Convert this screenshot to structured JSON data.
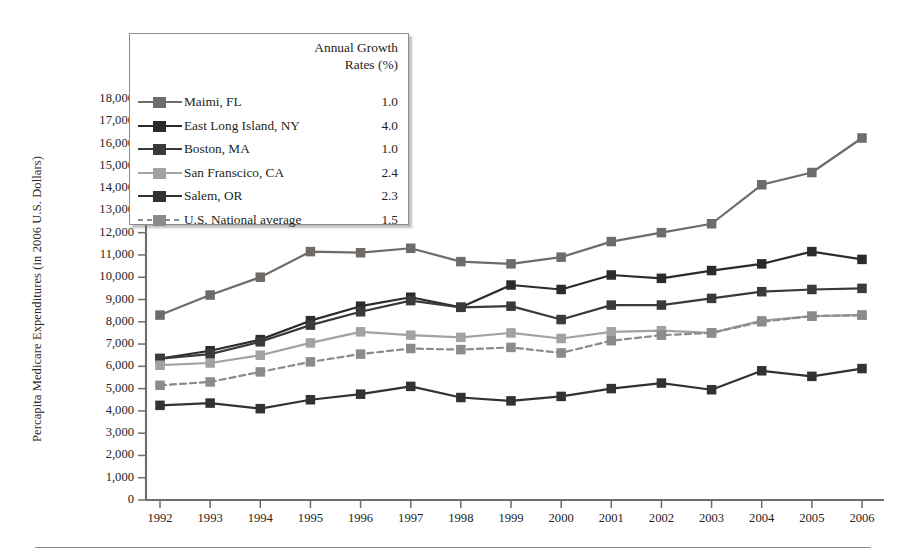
{
  "figure": {
    "y_axis_title": "Percapita Medicare Expenditures (in 2006 U.S. Dollars)",
    "legend_title_line1": "Annual Growth",
    "legend_title_line2": "Rates (%)"
  },
  "chart_data": {
    "type": "line",
    "title": "",
    "xlabel": "",
    "ylabel": "Percapita Medicare Expenditures (in 2006 U.S. Dollars)",
    "ylim": [
      0,
      18000
    ],
    "ytick_step": 1000,
    "yticks": [
      "0",
      "1,000",
      "2,000",
      "3,000",
      "4,000",
      "5,000",
      "6,000",
      "7,000",
      "8,000",
      "9,000",
      "10,000",
      "11,000",
      "12,000",
      "13,000",
      "14,000",
      "15,000",
      "16,000",
      "17,000",
      "18,000"
    ],
    "grid": false,
    "legend_position": "upper-left-inset",
    "categories": [
      1992,
      1993,
      1994,
      1995,
      1996,
      1997,
      1998,
      1999,
      2000,
      2001,
      2002,
      2003,
      2004,
      2005,
      2006
    ],
    "xtick_labels": [
      "1992",
      "1993",
      "1994",
      "1995",
      "1996",
      "1997",
      "1998",
      "1999",
      "2000",
      "2001",
      "2002",
      "2003",
      "2004",
      "2005",
      "2006"
    ],
    "series": [
      {
        "name": "Maimi, FL",
        "growth_rate": "1.0",
        "color": "#6e6b69",
        "dash": "solid",
        "values": [
          8300,
          9200,
          10000,
          11150,
          11100,
          11300,
          10700,
          10600,
          10900,
          11600,
          12000,
          12400,
          14150,
          14700,
          16250
        ]
      },
      {
        "name": "East Long Island, NY",
        "growth_rate": "4.0",
        "color": "#2b2b2b",
        "dash": "solid",
        "values": [
          6350,
          6700,
          7200,
          8050,
          8700,
          9100,
          8650,
          9650,
          9450,
          10100,
          9950,
          10300,
          10600,
          11150,
          10800
        ]
      },
      {
        "name": "Boston, MA",
        "growth_rate": "1.0",
        "color": "#3c3a39",
        "dash": "solid",
        "values": [
          6350,
          6550,
          7100,
          7850,
          8450,
          8950,
          8650,
          8700,
          8100,
          8750,
          8750,
          9050,
          9350,
          9450,
          9500
        ]
      },
      {
        "name": "San Franscico, CA",
        "growth_rate": "2.4",
        "color": "#a4a2a0",
        "dash": "solid",
        "values": [
          6050,
          6150,
          6500,
          7050,
          7550,
          7400,
          7300,
          7500,
          7250,
          7550,
          7600,
          7500,
          8050,
          8250,
          8300
        ]
      },
      {
        "name": "Salem, OR",
        "growth_rate": "2.3",
        "color": "#333132",
        "dash": "solid",
        "values": [
          4250,
          4350,
          4100,
          4500,
          4750,
          5100,
          4600,
          4450,
          4650,
          5000,
          5250,
          4950,
          5800,
          5550,
          5900
        ]
      },
      {
        "name": "U.S. National average",
        "growth_rate": "1.5",
        "color": "#8d8b89",
        "dash": "dashed",
        "values": [
          5150,
          5300,
          5750,
          6200,
          6550,
          6800,
          6750,
          6850,
          6600,
          7150,
          7400,
          7500,
          8000,
          8250,
          8300
        ]
      }
    ]
  }
}
